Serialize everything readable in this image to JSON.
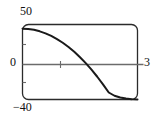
{
  "chart_data": {
    "type": "line",
    "title": "",
    "xlabel": "",
    "ylabel": "",
    "xlim": [
      0,
      3
    ],
    "ylim": [
      -40,
      50
    ],
    "grid": false,
    "legend": null,
    "axis_tick_labels": {
      "y_top": "50",
      "y_zero": "0",
      "y_bottom": "−40",
      "x_right": "3"
    },
    "x_axis_tick_values": [
      1
    ],
    "y_axis_tick_values": [
      -20,
      25
    ],
    "series": [
      {
        "name": "curve",
        "color": "#1a1a1a",
        "x": [
          0.0,
          0.15,
          0.3,
          0.45,
          0.6,
          0.75,
          0.9,
          1.05,
          1.2,
          1.35,
          1.5,
          1.65,
          1.8,
          1.95,
          2.1,
          2.25,
          2.4,
          2.55,
          2.7,
          2.85,
          3.0
        ],
        "y": [
          45.0,
          44.6,
          43.6,
          41.8,
          39.4,
          36.3,
          32.5,
          28.1,
          23.0,
          17.2,
          10.7,
          3.6,
          -4.2,
          -12.7,
          -21.8,
          -31.6,
          -35.5,
          -37.6,
          -38.9,
          -39.6,
          -40.0
        ]
      }
    ],
    "zero_crossing_x": 2.08,
    "frame": {
      "style": "rounded-rectangle",
      "stroke": "#2b2b2b"
    },
    "axis_line_color": "#6b6b6b"
  }
}
